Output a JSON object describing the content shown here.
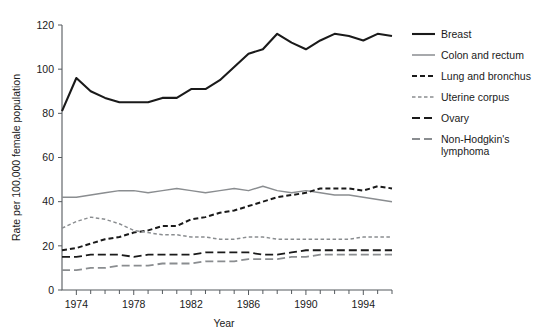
{
  "chart_data": {
    "type": "line",
    "title": "",
    "xlabel": "Year",
    "ylabel": "Rate per 100,000 female population",
    "xlim": [
      1973,
      1996
    ],
    "ylim": [
      0,
      120
    ],
    "ytick_step": 20,
    "yticks": [
      0,
      20,
      40,
      60,
      80,
      100,
      120
    ],
    "ytick_labels": [
      "0",
      "20",
      "40",
      "60",
      "80",
      "100",
      "120"
    ],
    "xticks": [
      1974,
      1978,
      1982,
      1986,
      1990,
      1994
    ],
    "xtick_labels": [
      "1974",
      "1978",
      "1982",
      "1986",
      "1990",
      "1994"
    ],
    "xtick_minor_step": 1,
    "grid": false,
    "legend_position": "right",
    "x": [
      1973,
      1974,
      1975,
      1976,
      1977,
      1978,
      1979,
      1980,
      1981,
      1982,
      1983,
      1984,
      1985,
      1986,
      1987,
      1988,
      1989,
      1990,
      1991,
      1992,
      1993,
      1994,
      1995,
      1996
    ],
    "series": [
      {
        "name": "Breast",
        "color": "#1a1a1a",
        "style": "solid",
        "width": 2.1,
        "values": [
          81,
          96,
          90,
          87,
          85,
          85,
          85,
          87,
          87,
          91,
          91,
          95,
          101,
          107,
          109,
          116,
          112,
          109,
          113,
          116,
          115,
          113,
          116,
          115
        ]
      },
      {
        "name": "Colon and rectum",
        "color": "#8a8d90",
        "style": "solid",
        "width": 1.5,
        "values": [
          42,
          42,
          43,
          44,
          45,
          45,
          44,
          45,
          46,
          45,
          44,
          45,
          46,
          45,
          47,
          45,
          44,
          45,
          44,
          43,
          43,
          42,
          41,
          40
        ]
      },
      {
        "name": "Lung and bronchus",
        "color": "#1a1a1a",
        "style": "dashed",
        "width": 2.0,
        "values": [
          18,
          19,
          21,
          23,
          24,
          26,
          27,
          29,
          29,
          32,
          33,
          35,
          36,
          38,
          40,
          42,
          43,
          44,
          46,
          46,
          46,
          45,
          47,
          46
        ]
      },
      {
        "name": "Uterine corpus",
        "color": "#8a8d90",
        "style": "shortdash",
        "width": 1.5,
        "values": [
          28,
          31,
          33,
          32,
          30,
          27,
          26,
          25,
          25,
          24,
          24,
          23,
          23,
          24,
          24,
          23,
          23,
          23,
          23,
          23,
          23,
          24,
          24,
          24
        ]
      },
      {
        "name": "Ovary",
        "color": "#1a1a1a",
        "style": "longdash",
        "width": 1.8,
        "values": [
          15,
          15,
          16,
          16,
          16,
          15,
          16,
          16,
          16,
          16,
          17,
          17,
          17,
          17,
          16,
          16,
          17,
          18,
          18,
          18,
          18,
          18,
          18,
          18
        ]
      },
      {
        "name": "Non-Hodgkin's lymphoma",
        "color": "#8a8d90",
        "style": "longdash",
        "width": 1.8,
        "values": [
          9,
          9,
          10,
          10,
          11,
          11,
          11,
          12,
          12,
          12,
          13,
          13,
          13,
          14,
          14,
          14,
          15,
          15,
          16,
          16,
          16,
          16,
          16,
          16
        ]
      }
    ],
    "legend": [
      {
        "label": "Breast"
      },
      {
        "label": "Colon and rectum"
      },
      {
        "label": "Lung and bronchus"
      },
      {
        "label": "Uterine corpus"
      },
      {
        "label": "Ovary"
      },
      {
        "label": "Non-Hodgkin's",
        "label2": "lymphoma"
      }
    ]
  }
}
